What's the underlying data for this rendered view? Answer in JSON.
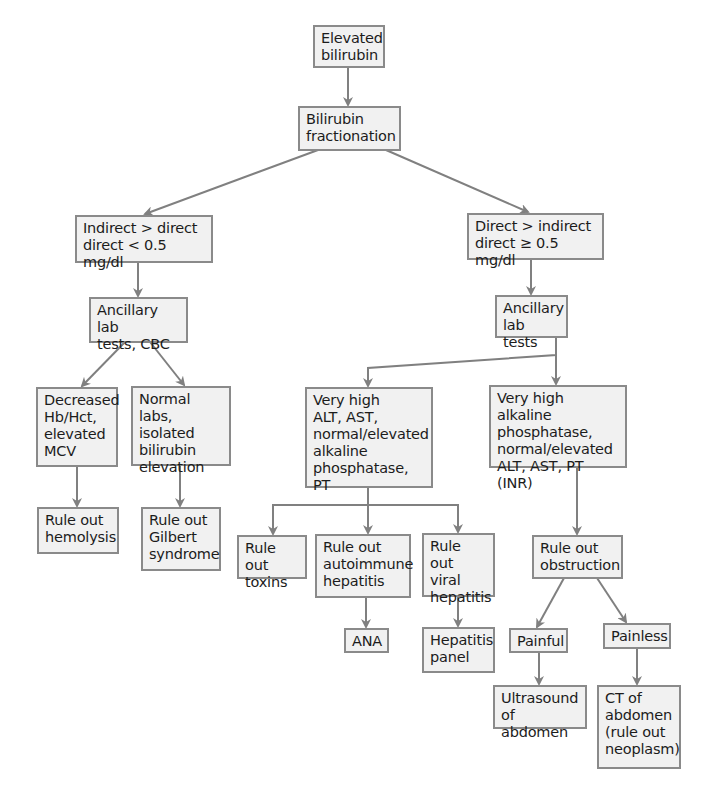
{
  "diagram": {
    "type": "flowchart",
    "colors": {
      "box_fill": "#f1f1f1",
      "box_border": "#8a8a8a",
      "arrow": "#808080",
      "text": "#1c1c1c"
    },
    "nodes": {
      "elevated_bilirubin": "Elevated\nbilirubin",
      "fractionation": "Bilirubin\nfractionation",
      "indirect_gt_direct": "Indirect > direct\ndirect < 0.5 mg/dl",
      "direct_gt_indirect": "Direct > indirect\ndirect ≥ 0.5 mg/dl",
      "ancillary_cbc": "Ancillary lab\ntests, CBC",
      "ancillary_right": "Ancillary\nlab tests",
      "decreased_hb": "Decreased\nHb/Hct,\nelevated\nMCV",
      "normal_labs": "Normal labs,\nisolated\nbilirubin\nelevation",
      "very_high_alt": "Very high\nALT, AST,\nnormal/elevated\nalkaline\nphosphatase, PT",
      "very_high_alk": "Very high alkaline\nphosphatase,\nnormal/elevated\nALT, AST, PT (INR)",
      "rule_out_hemolysis": "Rule out\nhemolysis",
      "rule_out_gilbert": "Rule out\nGilbert\nsyndrome",
      "rule_out_toxins": "Rule out\ntoxins",
      "rule_out_autoimmune": "Rule out\nautoimmune\nhepatitis",
      "rule_out_viral": "Rule\nout viral\nhepatitis",
      "rule_out_obstruction": "Rule out\nobstruction",
      "ana": "ANA",
      "hepatitis_panel": "Hepatitis\npanel",
      "painful": "Painful",
      "painless": "Painless",
      "ultrasound": "Ultrasound\nof abdomen",
      "ct_abdomen": "CT of\nabdomen\n(rule out\nneoplasm)"
    },
    "edges": [
      [
        "elevated_bilirubin",
        "fractionation"
      ],
      [
        "fractionation",
        "indirect_gt_direct"
      ],
      [
        "fractionation",
        "direct_gt_indirect"
      ],
      [
        "indirect_gt_direct",
        "ancillary_cbc"
      ],
      [
        "direct_gt_indirect",
        "ancillary_right"
      ],
      [
        "ancillary_cbc",
        "decreased_hb"
      ],
      [
        "ancillary_cbc",
        "normal_labs"
      ],
      [
        "decreased_hb",
        "rule_out_hemolysis"
      ],
      [
        "normal_labs",
        "rule_out_gilbert"
      ],
      [
        "ancillary_right",
        "very_high_alt"
      ],
      [
        "ancillary_right",
        "very_high_alk"
      ],
      [
        "very_high_alt",
        "rule_out_toxins"
      ],
      [
        "very_high_alt",
        "rule_out_autoimmune"
      ],
      [
        "very_high_alt",
        "rule_out_viral"
      ],
      [
        "rule_out_autoimmune",
        "ana"
      ],
      [
        "rule_out_viral",
        "hepatitis_panel"
      ],
      [
        "very_high_alk",
        "rule_out_obstruction"
      ],
      [
        "rule_out_obstruction",
        "painful"
      ],
      [
        "rule_out_obstruction",
        "painless"
      ],
      [
        "painful",
        "ultrasound"
      ],
      [
        "painless",
        "ct_abdomen"
      ]
    ]
  }
}
